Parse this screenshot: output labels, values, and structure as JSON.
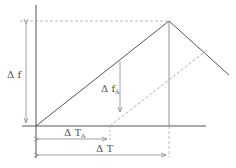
{
  "diagram": {
    "type": "frequency-time ramp diagram",
    "labels": {
      "delta_f": "Δ f",
      "delta_fA_main": "Δ f",
      "delta_fA_sub": "A",
      "delta_TA_main": "Δ T",
      "delta_TA_sub": "A",
      "delta_T": "Δ T"
    },
    "colors": {
      "line": "#555555",
      "dashed": "#9a9a9a",
      "arrow": "#8a8a8a",
      "background": "#ffffff"
    }
  }
}
